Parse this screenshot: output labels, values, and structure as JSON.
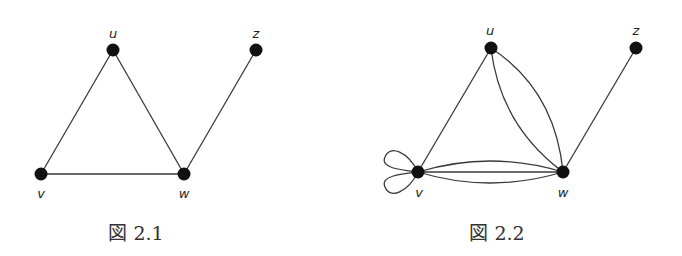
{
  "figures": [
    {
      "caption": "図 2.1",
      "vertices": [
        {
          "id": "u",
          "label": "u"
        },
        {
          "id": "z",
          "label": "z"
        },
        {
          "id": "v",
          "label": "v"
        },
        {
          "id": "w",
          "label": "w"
        }
      ],
      "edges": [
        {
          "from": "u",
          "to": "v"
        },
        {
          "from": "u",
          "to": "w"
        },
        {
          "from": "v",
          "to": "w"
        },
        {
          "from": "w",
          "to": "z"
        }
      ]
    },
    {
      "caption": "図 2.2",
      "vertices": [
        {
          "id": "u",
          "label": "u"
        },
        {
          "id": "z",
          "label": "z"
        },
        {
          "id": "v",
          "label": "v"
        },
        {
          "id": "w",
          "label": "w"
        }
      ],
      "edges": [
        {
          "from": "u",
          "to": "v"
        },
        {
          "from": "u",
          "to": "w",
          "multiplicity": 2
        },
        {
          "from": "v",
          "to": "w",
          "multiplicity": 3
        },
        {
          "from": "v",
          "to": "v",
          "type": "loop",
          "multiplicity": 2
        },
        {
          "from": "w",
          "to": "z"
        }
      ]
    }
  ]
}
